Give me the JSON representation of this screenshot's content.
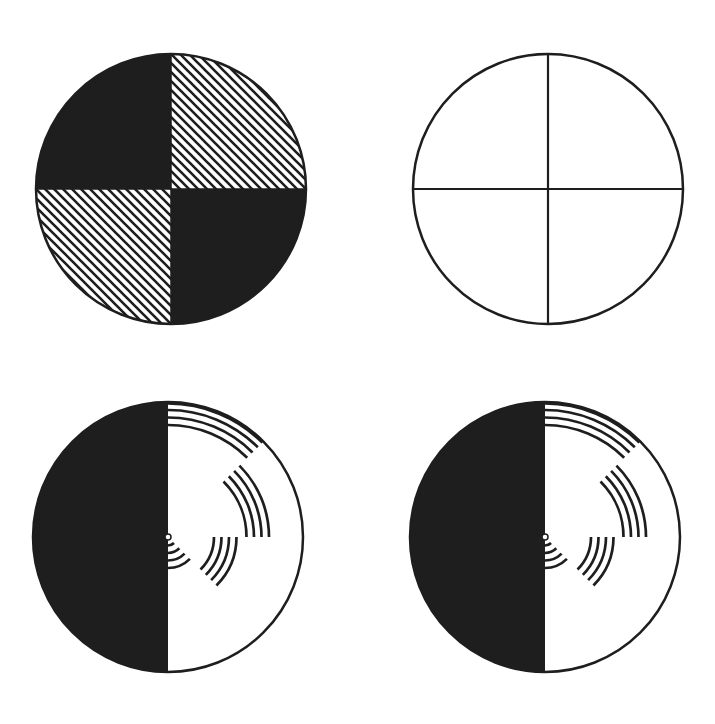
{
  "figure": {
    "colors": {
      "ink": "#1e1e1e",
      "paper": "#ffffff"
    },
    "disks": [
      {
        "id": "checker-hatched-disk",
        "cx": 171,
        "cy": 189,
        "r": 135,
        "quadrants": [
          "solid",
          "hatched",
          "hatched",
          "solid"
        ],
        "quadrant_order": [
          "top-left",
          "top-right",
          "bottom-left",
          "bottom-right"
        ]
      },
      {
        "id": "quartered-outline-disk",
        "cx": 548,
        "cy": 189,
        "r": 135
      },
      {
        "id": "benham-disk-left",
        "cx": 168,
        "cy": 537,
        "r": 135
      },
      {
        "id": "benham-disk-right",
        "cx": 545,
        "cy": 537,
        "r": 135
      }
    ],
    "benham_arc_groups": [
      {
        "name": "outer-group",
        "start_deg": 90,
        "end_deg": 45,
        "radii": [
          135,
          127,
          119.5,
          112
        ]
      },
      {
        "name": "upper-middle-group",
        "start_deg": 45,
        "end_deg": 0,
        "radii": [
          101,
          93.5,
          86,
          78.5
        ]
      },
      {
        "name": "lower-middle-group",
        "start_deg": 0,
        "end_deg": -45,
        "radii": [
          68.5,
          61,
          53.5,
          46
        ]
      },
      {
        "name": "inner-group",
        "start_deg": -45,
        "end_deg": -90,
        "radii": [
          31,
          23.5,
          16,
          8.5
        ]
      }
    ]
  }
}
